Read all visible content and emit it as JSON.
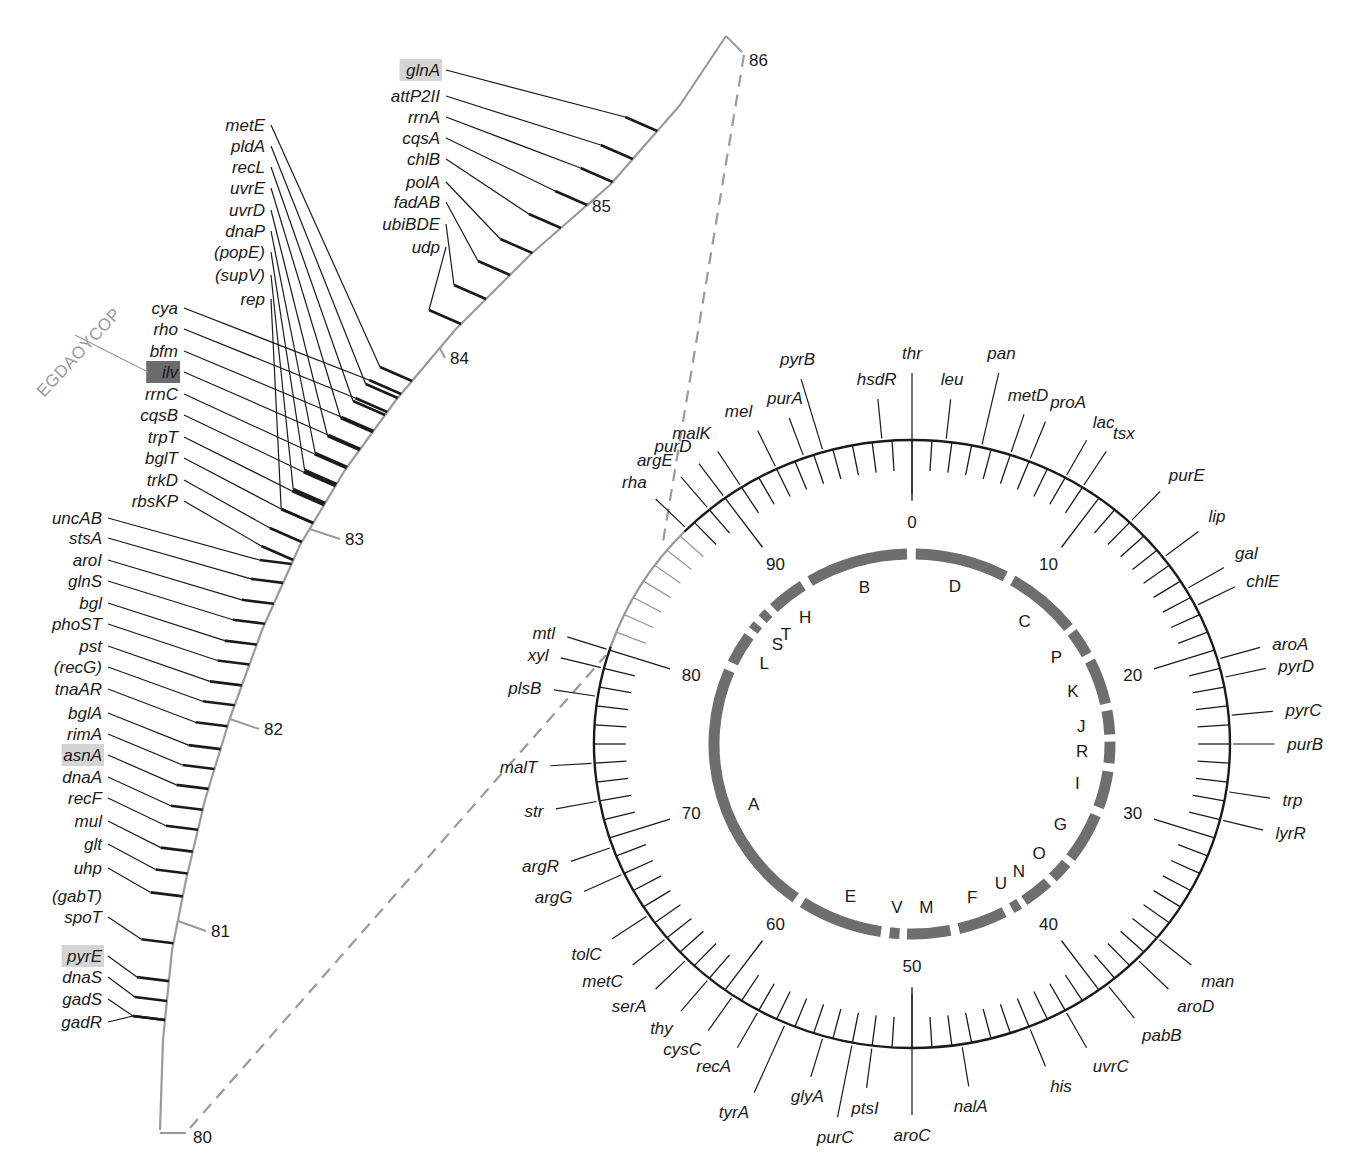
{
  "figure": {
    "colors": {
      "line": "#1a1a1a",
      "gray_line": "#9a9a9a",
      "segment": "#6e6e6e",
      "highlight_light": "#d4d4d4",
      "highlight_dark": "#6b6b6b"
    }
  },
  "expanded_map": {
    "range_start": "80",
    "range_end": "86",
    "minute_labels": [
      {
        "label": "80",
        "x": 193,
        "y": 1143
      },
      {
        "label": "81",
        "x": 211,
        "y": 937
      },
      {
        "label": "82",
        "x": 264,
        "y": 735
      },
      {
        "label": "83",
        "x": 345,
        "y": 545
      },
      {
        "label": "84",
        "x": 450,
        "y": 364
      },
      {
        "label": "85",
        "x": 592,
        "y": 212
      },
      {
        "label": "86",
        "x": 749,
        "y": 66
      }
    ],
    "operon_label": "EGDAOYCOP",
    "genes": [
      {
        "name": "glnA",
        "x": 440,
        "y": 76,
        "highlight": "light"
      },
      {
        "name": "attP2II",
        "x": 440,
        "y": 102
      },
      {
        "name": "rrnA",
        "x": 440,
        "y": 123
      },
      {
        "name": "cqsA",
        "x": 440,
        "y": 144
      },
      {
        "name": "chlB",
        "x": 440,
        "y": 165
      },
      {
        "name": "polA",
        "x": 440,
        "y": 188
      },
      {
        "name": "fadAB",
        "x": 440,
        "y": 208
      },
      {
        "name": "ubiBDE",
        "x": 440,
        "y": 230
      },
      {
        "name": "udp",
        "x": 440,
        "y": 253
      },
      {
        "name": "metE",
        "x": 265,
        "y": 131
      },
      {
        "name": "pldA",
        "x": 265,
        "y": 152
      },
      {
        "name": "recL",
        "x": 265,
        "y": 173
      },
      {
        "name": "uvrE",
        "x": 265,
        "y": 194
      },
      {
        "name": "uvrD",
        "x": 265,
        "y": 216
      },
      {
        "name": "dnaP",
        "x": 265,
        "y": 237
      },
      {
        "name": "(popE)",
        "x": 265,
        "y": 258
      },
      {
        "name": "(supV)",
        "x": 265,
        "y": 281
      },
      {
        "name": "rep",
        "x": 265,
        "y": 305
      },
      {
        "name": "cya",
        "x": 178,
        "y": 314
      },
      {
        "name": "rho",
        "x": 178,
        "y": 335
      },
      {
        "name": "bfm",
        "x": 178,
        "y": 357
      },
      {
        "name": "ilv",
        "x": 178,
        "y": 378,
        "highlight": "dark"
      },
      {
        "name": "rrnC",
        "x": 178,
        "y": 400
      },
      {
        "name": "cqsB",
        "x": 178,
        "y": 421
      },
      {
        "name": "trpT",
        "x": 178,
        "y": 443
      },
      {
        "name": "bglT",
        "x": 178,
        "y": 464
      },
      {
        "name": "trkD",
        "x": 178,
        "y": 486
      },
      {
        "name": "rbsKP",
        "x": 178,
        "y": 507
      },
      {
        "name": "uncAB",
        "x": 102,
        "y": 524
      },
      {
        "name": "stsA",
        "x": 102,
        "y": 544
      },
      {
        "name": "aroI",
        "x": 102,
        "y": 566
      },
      {
        "name": "glnS",
        "x": 102,
        "y": 587
      },
      {
        "name": "bgl",
        "x": 102,
        "y": 609
      },
      {
        "name": "phoST",
        "x": 102,
        "y": 630
      },
      {
        "name": "pst",
        "x": 102,
        "y": 652
      },
      {
        "name": "(recG)",
        "x": 102,
        "y": 673
      },
      {
        "name": "tnaAR",
        "x": 102,
        "y": 695
      },
      {
        "name": "bglA",
        "x": 102,
        "y": 719
      },
      {
        "name": "rimA",
        "x": 102,
        "y": 740
      },
      {
        "name": "asnA",
        "x": 102,
        "y": 761,
        "highlight": "light"
      },
      {
        "name": "dnaA",
        "x": 102,
        "y": 783
      },
      {
        "name": "recF",
        "x": 102,
        "y": 804
      },
      {
        "name": "mul",
        "x": 102,
        "y": 827
      },
      {
        "name": "glt",
        "x": 102,
        "y": 850
      },
      {
        "name": "uhp",
        "x": 102,
        "y": 874
      },
      {
        "name": "(gabT)",
        "x": 102,
        "y": 902
      },
      {
        "name": "spoT",
        "x": 102,
        "y": 923
      },
      {
        "name": "pyrE",
        "x": 102,
        "y": 962,
        "highlight": "light"
      },
      {
        "name": "dnaS",
        "x": 102,
        "y": 983
      },
      {
        "name": "gadS",
        "x": 102,
        "y": 1005
      },
      {
        "name": "gadR",
        "x": 102,
        "y": 1028
      }
    ]
  },
  "circular_map": {
    "total_minutes": 100,
    "minute_labels": [
      "0",
      "10",
      "20",
      "30",
      "40",
      "50",
      "60",
      "70",
      "80",
      "90"
    ],
    "outer_genes": [
      {
        "name": "thr",
        "min": 0
      },
      {
        "name": "leu",
        "min": 1.7
      },
      {
        "name": "pan",
        "min": 3.5
      },
      {
        "name": "metD",
        "min": 5
      },
      {
        "name": "proA",
        "min": 6
      },
      {
        "name": "lac",
        "min": 8
      },
      {
        "name": "tsx",
        "min": 9
      },
      {
        "name": "purE",
        "min": 12
      },
      {
        "name": "lip",
        "min": 14.5
      },
      {
        "name": "gal",
        "min": 16.5
      },
      {
        "name": "chlE",
        "min": 17.5
      },
      {
        "name": "aroA",
        "min": 20.5
      },
      {
        "name": "pyrD",
        "min": 21.5
      },
      {
        "name": "pyrC",
        "min": 23.5
      },
      {
        "name": "purB",
        "min": 25
      },
      {
        "name": "trp",
        "min": 27.5
      },
      {
        "name": "lyrR",
        "min": 29
      },
      {
        "name": "man",
        "min": 36
      },
      {
        "name": "aroD",
        "min": 37.5
      },
      {
        "name": "pabB",
        "min": 39.5
      },
      {
        "name": "uvrC",
        "min": 42
      },
      {
        "name": "his",
        "min": 44
      },
      {
        "name": "nalA",
        "min": 47.5
      },
      {
        "name": "aroC",
        "min": 50
      },
      {
        "name": "ptsI",
        "min": 52
      },
      {
        "name": "purC",
        "min": 53
      },
      {
        "name": "glyA",
        "min": 54.5
      },
      {
        "name": "tyrA",
        "min": 56.5
      },
      {
        "name": "recA",
        "min": 58
      },
      {
        "name": "cysC",
        "min": 59.5
      },
      {
        "name": "thy",
        "min": 61
      },
      {
        "name": "serA",
        "min": 62.5
      },
      {
        "name": "metC",
        "min": 64
      },
      {
        "name": "tolC",
        "min": 65.5
      },
      {
        "name": "argG",
        "min": 68
      },
      {
        "name": "argR",
        "min": 69.5
      },
      {
        "name": "str",
        "min": 72
      },
      {
        "name": "malT",
        "min": 74
      },
      {
        "name": "plsB",
        "min": 77.5
      },
      {
        "name": "xyl",
        "min": 79
      },
      {
        "name": "mtl",
        "min": 80
      },
      {
        "name": "rha",
        "min": 87.5
      },
      {
        "name": "argE",
        "min": 89
      },
      {
        "name": "purD",
        "min": 90
      },
      {
        "name": "malK",
        "min": 91
      },
      {
        "name": "mel",
        "min": 93
      },
      {
        "name": "purA",
        "min": 94.5
      },
      {
        "name": "pyrB",
        "min": 95.5
      },
      {
        "name": "hsdR",
        "min": 98.5
      }
    ],
    "segments": [
      {
        "label": "D",
        "start": 0.3,
        "end": 7.8
      },
      {
        "label": "C",
        "start": 8.5,
        "end": 14.5
      },
      {
        "label": "P",
        "start": 15.0,
        "end": 17.2
      },
      {
        "label": "K",
        "start": 17.8,
        "end": 21.6
      },
      {
        "label": "J",
        "start": 22.2,
        "end": 24.2
      },
      {
        "label": "R",
        "start": 24.8,
        "end": 26.6
      },
      {
        "label": "I",
        "start": 27.3,
        "end": 30.4
      },
      {
        "label": "G",
        "start": 31.1,
        "end": 35.2
      },
      {
        "label": "O",
        "start": 35.8,
        "end": 37.4
      },
      {
        "label": "N",
        "start": 38.0,
        "end": 40.4
      },
      {
        "label": "U",
        "start": 40.9,
        "end": 41.6
      },
      {
        "label": "F",
        "start": 42.3,
        "end": 46.2
      },
      {
        "label": "M",
        "start": 46.9,
        "end": 50.4
      },
      {
        "label": "V",
        "start": 51.0,
        "end": 51.8
      },
      {
        "label": "E",
        "start": 52.5,
        "end": 59.3
      },
      {
        "label": "A",
        "start": 60.0,
        "end": 81.3
      },
      {
        "label": "L",
        "start": 82.0,
        "end": 84.6
      },
      {
        "label": "S",
        "start": 85.2,
        "end": 85.8
      },
      {
        "label": "T",
        "start": 86.4,
        "end": 87.1
      },
      {
        "label": "H",
        "start": 87.7,
        "end": 90.7
      },
      {
        "label": "B",
        "start": 91.4,
        "end": 99.6
      }
    ]
  }
}
